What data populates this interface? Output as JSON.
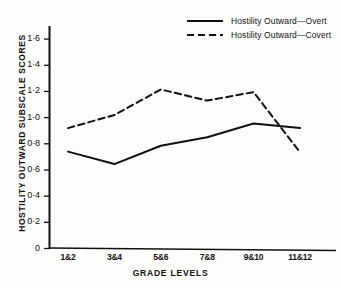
{
  "chart_data": {
    "type": "line",
    "title": "",
    "xlabel": "GRADE  LEVELS",
    "ylabel": "HOSTILITY  OUTWARD  SUBSCALE  SCORES",
    "categories": [
      "1&2",
      "3&4",
      "5&6",
      "7&8",
      "9&10",
      "11&12"
    ],
    "ylim": [
      0,
      1.7
    ],
    "ytick_labels": [
      "0",
      "0·2",
      "0·4",
      "0·6",
      "0·8",
      "1·0",
      "1·2",
      "1·4",
      "1·6"
    ],
    "ytick_values": [
      0,
      0.2,
      0.4,
      0.6,
      0.8,
      1.0,
      1.2,
      1.4,
      1.6
    ],
    "grid": false,
    "legend_position": "top-right",
    "series": [
      {
        "name": "Hostility Outward—Overt",
        "style": "solid",
        "color": "#111111",
        "values": [
          0.74,
          0.645,
          0.785,
          0.85,
          0.955,
          0.92
        ]
      },
      {
        "name": "Hostility Outward—Covert",
        "style": "dashed",
        "color": "#111111",
        "values": [
          0.92,
          1.02,
          1.215,
          1.13,
          1.195,
          0.735
        ]
      }
    ]
  }
}
